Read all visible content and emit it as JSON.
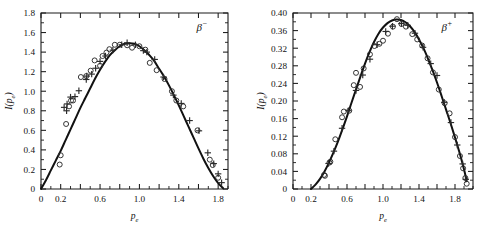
{
  "figure": {
    "background_color": "#ffffff",
    "ink_color": "#111111",
    "panel_count": 2
  },
  "chart_data": [
    {
      "type": "line",
      "id": "beta-minus",
      "title": "",
      "annotation": "β",
      "annotation_superscript": "−",
      "annotation_full": "β⁻",
      "xlabel": "p_e",
      "xlabel_base": "p",
      "xlabel_sub": "e",
      "ylabel": "I(p_e)",
      "ylabel_parts": [
        "I(",
        "p",
        "e",
        ")"
      ],
      "xlim": [
        0,
        1.9
      ],
      "ylim": [
        0,
        1.8
      ],
      "grid": false,
      "legend": "none",
      "xticks": [
        0,
        0.2,
        0.4,
        0.6,
        0.8,
        1.0,
        1.2,
        1.4,
        1.6,
        1.8
      ],
      "xticklabels": [
        "0",
        "0.2",
        "",
        "0.6",
        "",
        "1.0",
        "",
        "1.4",
        "",
        "1.8"
      ],
      "yticks": [
        0,
        0.2,
        0.4,
        0.6,
        0.8,
        1.0,
        1.2,
        1.4,
        1.6,
        1.8
      ],
      "yticklabels": [
        "0",
        "0.2",
        "0.4",
        "0.6",
        "0.8",
        "1.0",
        "1.2",
        "1.4",
        "1.6",
        "1.8"
      ],
      "x_minor_step": 0.1,
      "y_minor_step": 0.1,
      "curve": {
        "name": "theory",
        "x": [
          0.0,
          0.05,
          0.1,
          0.15,
          0.2,
          0.25,
          0.3,
          0.35,
          0.4,
          0.45,
          0.5,
          0.55,
          0.6,
          0.65,
          0.7,
          0.75,
          0.8,
          0.85,
          0.9,
          0.95,
          1.0,
          1.05,
          1.1,
          1.15,
          1.2,
          1.25,
          1.3,
          1.35,
          1.4,
          1.45,
          1.5,
          1.55,
          1.6,
          1.65,
          1.7,
          1.75,
          1.8,
          1.85
        ],
        "y": [
          0.0,
          0.09,
          0.19,
          0.29,
          0.39,
          0.5,
          0.61,
          0.72,
          0.83,
          0.93,
          1.03,
          1.13,
          1.22,
          1.3,
          1.37,
          1.42,
          1.46,
          1.485,
          1.49,
          1.485,
          1.46,
          1.42,
          1.37,
          1.31,
          1.23,
          1.15,
          1.06,
          0.96,
          0.855,
          0.745,
          0.635,
          0.525,
          0.415,
          0.31,
          0.215,
          0.13,
          0.06,
          0.008
        ]
      },
      "series": [
        {
          "name": "circle-data",
          "marker": "open-circle",
          "points": [
            [
              0.19,
              0.25
            ],
            [
              0.2,
              0.345
            ],
            [
              0.255,
              0.665
            ],
            [
              0.285,
              0.845
            ],
            [
              0.305,
              0.905
            ],
            [
              0.325,
              0.905
            ],
            [
              0.405,
              1.145
            ],
            [
              0.46,
              1.155
            ],
            [
              0.505,
              1.21
            ],
            [
              0.545,
              1.315
            ],
            [
              0.6,
              1.26
            ],
            [
              0.625,
              1.36
            ],
            [
              0.665,
              1.395
            ],
            [
              0.695,
              1.43
            ],
            [
              0.75,
              1.475
            ],
            [
              0.8,
              1.475
            ],
            [
              0.875,
              1.47
            ],
            [
              0.925,
              1.445
            ],
            [
              1.0,
              1.46
            ],
            [
              1.06,
              1.425
            ],
            [
              1.105,
              1.29
            ],
            [
              1.175,
              1.215
            ],
            [
              1.255,
              1.125
            ],
            [
              1.33,
              1.0
            ],
            [
              1.375,
              0.905
            ],
            [
              1.445,
              0.845
            ],
            [
              1.59,
              0.6
            ],
            [
              1.715,
              0.3
            ],
            [
              1.745,
              0.245
            ],
            [
              1.8,
              0.115
            ]
          ]
        },
        {
          "name": "cross-data",
          "marker": "plus-cross",
          "points": [
            [
              0.235,
              0.835
            ],
            [
              0.26,
              0.8
            ],
            [
              0.265,
              0.87
            ],
            [
              0.3,
              0.94
            ],
            [
              0.345,
              0.945
            ],
            [
              0.385,
              1.005
            ],
            [
              0.46,
              1.12
            ],
            [
              0.465,
              1.155
            ],
            [
              0.515,
              1.175
            ],
            [
              0.555,
              1.235
            ],
            [
              0.6,
              1.305
            ],
            [
              0.655,
              1.36
            ],
            [
              0.73,
              1.42
            ],
            [
              0.82,
              1.475
            ],
            [
              0.875,
              1.495
            ],
            [
              0.96,
              1.475
            ],
            [
              1.04,
              1.415
            ],
            [
              1.075,
              1.4
            ],
            [
              1.155,
              1.325
            ],
            [
              1.245,
              1.145
            ],
            [
              1.345,
              0.96
            ],
            [
              1.425,
              0.875
            ],
            [
              1.51,
              0.7
            ],
            [
              1.605,
              0.595
            ],
            [
              1.695,
              0.37
            ],
            [
              1.755,
              0.26
            ],
            [
              1.8,
              0.155
            ],
            [
              1.835,
              0.065
            ]
          ]
        }
      ]
    },
    {
      "type": "line",
      "id": "beta-plus",
      "title": "",
      "annotation": "β",
      "annotation_superscript": "+",
      "annotation_full": "β⁺",
      "xlabel": "p_e",
      "xlabel_base": "p",
      "xlabel_sub": "e",
      "ylabel": "I(p_e)",
      "ylabel_parts": [
        "I(",
        "p",
        "e",
        ")"
      ],
      "xlim": [
        0,
        2.0
      ],
      "ylim": [
        0,
        0.4
      ],
      "grid": false,
      "legend": "none",
      "xticks": [
        0,
        0.2,
        0.4,
        0.6,
        0.8,
        1.0,
        1.2,
        1.4,
        1.6,
        1.8
      ],
      "xticklabels": [
        "0",
        "0.2",
        "",
        "0.6",
        "",
        "1.0",
        "",
        "1.4",
        "",
        "1.8"
      ],
      "yticks": [
        0,
        0.04,
        0.08,
        0.12,
        0.16,
        0.2,
        0.24,
        0.28,
        0.32,
        0.36,
        0.4
      ],
      "yticklabels": [
        "0",
        "0.04",
        "0.08",
        "0.12",
        "0.16",
        "0.20",
        "0.24",
        "0.28",
        "0.32",
        "0.36",
        "0.40"
      ],
      "x_minor_step": 0.1,
      "y_minor_step": 0.02,
      "curve": {
        "name": "theory",
        "x": [
          0.2,
          0.25,
          0.3,
          0.35,
          0.4,
          0.45,
          0.5,
          0.55,
          0.6,
          0.65,
          0.7,
          0.75,
          0.8,
          0.85,
          0.9,
          0.95,
          1.0,
          1.05,
          1.1,
          1.15,
          1.2,
          1.25,
          1.3,
          1.35,
          1.4,
          1.45,
          1.5,
          1.55,
          1.6,
          1.65,
          1.7,
          1.75,
          1.8,
          1.85,
          1.9,
          1.93
        ],
        "y": [
          0.0,
          0.01,
          0.023,
          0.04,
          0.06,
          0.083,
          0.108,
          0.136,
          0.165,
          0.196,
          0.226,
          0.256,
          0.285,
          0.311,
          0.334,
          0.353,
          0.367,
          0.377,
          0.383,
          0.385,
          0.384,
          0.379,
          0.37,
          0.357,
          0.34,
          0.32,
          0.296,
          0.27,
          0.242,
          0.212,
          0.181,
          0.15,
          0.117,
          0.083,
          0.045,
          0.018
        ]
      },
      "series": [
        {
          "name": "circle-data",
          "marker": "open-circle",
          "points": [
            [
              0.345,
              0.032
            ],
            [
              0.355,
              0.03
            ],
            [
              0.405,
              0.06
            ],
            [
              0.415,
              0.062
            ],
            [
              0.47,
              0.113
            ],
            [
              0.545,
              0.163
            ],
            [
              0.565,
              0.176
            ],
            [
              0.625,
              0.178
            ],
            [
              0.675,
              0.236
            ],
            [
              0.7,
              0.264
            ],
            [
              0.745,
              0.232
            ],
            [
              0.785,
              0.274
            ],
            [
              0.855,
              0.306
            ],
            [
              0.905,
              0.325
            ],
            [
              0.96,
              0.33
            ],
            [
              1.0,
              0.337
            ],
            [
              1.055,
              0.353
            ],
            [
              1.11,
              0.369
            ],
            [
              1.155,
              0.386
            ],
            [
              1.205,
              0.375
            ],
            [
              1.255,
              0.369
            ],
            [
              1.325,
              0.352
            ],
            [
              1.38,
              0.34
            ],
            [
              1.435,
              0.326
            ],
            [
              1.495,
              0.297
            ],
            [
              1.555,
              0.265
            ],
            [
              1.62,
              0.226
            ],
            [
              1.685,
              0.195
            ],
            [
              1.74,
              0.172
            ],
            [
              1.8,
              0.118
            ],
            [
              1.855,
              0.075
            ],
            [
              1.89,
              0.047
            ],
            [
              1.915,
              0.025
            ],
            [
              1.93,
              0.012
            ]
          ]
        },
        {
          "name": "cross-data",
          "marker": "plus-cross",
          "points": [
            [
              0.395,
              0.058
            ],
            [
              0.455,
              0.086
            ],
            [
              0.545,
              0.138
            ],
            [
              0.615,
              0.178
            ],
            [
              0.7,
              0.224
            ],
            [
              0.775,
              0.259
            ],
            [
              0.855,
              0.295
            ],
            [
              0.935,
              0.328
            ],
            [
              1.03,
              0.358
            ],
            [
              1.105,
              0.37
            ],
            [
              1.205,
              0.376
            ],
            [
              1.275,
              0.372
            ],
            [
              1.355,
              0.354
            ],
            [
              1.445,
              0.322
            ],
            [
              1.53,
              0.285
            ],
            [
              1.6,
              0.258
            ],
            [
              1.68,
              0.197
            ],
            [
              1.755,
              0.151
            ],
            [
              1.825,
              0.1
            ],
            [
              1.885,
              0.057
            ],
            [
              1.92,
              0.022
            ]
          ]
        }
      ]
    }
  ]
}
